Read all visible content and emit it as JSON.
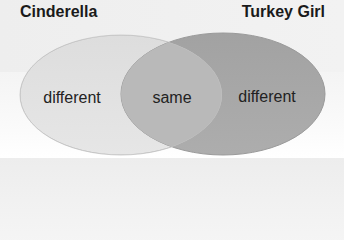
{
  "titles": {
    "left": "Cinderella",
    "right": "Turkey Girl"
  },
  "regions": {
    "left_only": "different",
    "overlap": "same",
    "right_only": "different"
  },
  "colors": {
    "left_circle": "#e2e2e2",
    "right_circle": "#a9a9a9",
    "overlap": "#b9b9b9",
    "left_stroke": "#cfcfcf",
    "right_stroke": "#9a9a9a",
    "text": "#222222"
  }
}
